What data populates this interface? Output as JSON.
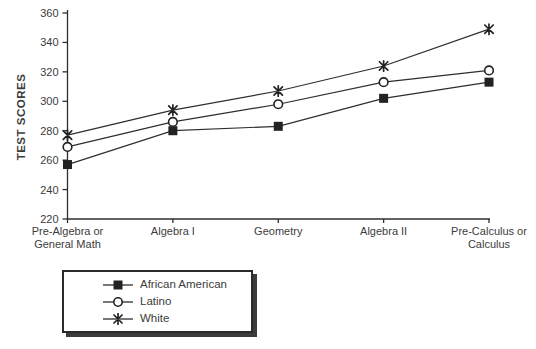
{
  "chart_data": {
    "type": "line",
    "ylabel": "TEST SCORES",
    "categories": [
      "Pre-Algebra or\nGeneral Math",
      "Algebra I",
      "Geometry",
      "Algebra II",
      "Pre-Calculus or\nCalculus"
    ],
    "yticks": [
      220,
      240,
      260,
      280,
      300,
      320,
      340,
      360
    ],
    "ylim": [
      220,
      360
    ],
    "grid": false,
    "legend_position": "bottom-left",
    "series": [
      {
        "name": "African American",
        "marker": "filled-square",
        "values": [
          257,
          280,
          283,
          302,
          313
        ]
      },
      {
        "name": "Latino",
        "marker": "open-circle",
        "values": [
          269,
          286,
          298,
          313,
          321
        ]
      },
      {
        "name": "White",
        "marker": "star",
        "values": [
          277,
          294,
          307,
          324,
          349
        ]
      }
    ]
  },
  "colors": {
    "line": "#2e2e2e",
    "marker": "#222222",
    "text": "#3c3c3c",
    "background": "#ffffff",
    "legend_border": "#2a2a2a",
    "legend_shadow": "#3b3b3b"
  }
}
